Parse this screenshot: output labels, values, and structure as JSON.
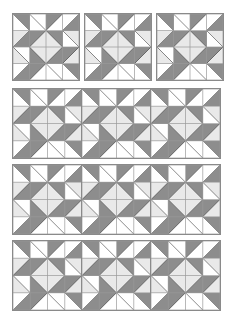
{
  "figure": {
    "background_color": "#ffffff",
    "width": 240,
    "height": 318
  },
  "palette": {
    "dark": "#8d8d8d",
    "light": "#e9e9e9",
    "white": "#ffffff",
    "stroke": "#5a5a5a",
    "grid_stroke": "#9a9a9a",
    "frame_stroke": "#8a8a8a"
  },
  "block_design": {
    "name": "pinwheel-star-block",
    "grid_rows": 4,
    "grid_cols": 4,
    "unit_type": "half-square-triangle",
    "description": "4 by 4 grid of half square triangle units arranged as a rotating pinwheel star",
    "units": [
      [
        {
          "split": "tlbr",
          "a": "dark",
          "b": "white"
        },
        {
          "split": "tlbr",
          "a": "white",
          "b": "white"
        },
        {
          "split": "trbl",
          "a": "dark",
          "b": "white"
        },
        {
          "split": "trbl",
          "a": "white",
          "b": "dark"
        }
      ],
      [
        {
          "split": "trbl",
          "a": "light",
          "b": "dark"
        },
        {
          "split": "trbl",
          "a": "dark",
          "b": "light"
        },
        {
          "split": "tlbr",
          "a": "dark",
          "b": "light"
        },
        {
          "split": "tlbr",
          "a": "light",
          "b": "white"
        }
      ],
      [
        {
          "split": "tlbr",
          "a": "white",
          "b": "light"
        },
        {
          "split": "tlbr",
          "a": "light",
          "b": "dark"
        },
        {
          "split": "trbl",
          "a": "light",
          "b": "dark"
        },
        {
          "split": "trbl",
          "a": "dark",
          "b": "light"
        }
      ],
      [
        {
          "split": "trbl",
          "a": "white",
          "b": "dark"
        },
        {
          "split": "trbl",
          "a": "dark",
          "b": "white"
        },
        {
          "split": "tlbr",
          "a": "white",
          "b": "white"
        },
        {
          "split": "tlbr",
          "a": "dark",
          "b": "white"
        }
      ]
    ]
  },
  "bands": [
    {
      "name": "band-row-1",
      "label": "Row 1 — three separated blocks",
      "x": 13,
      "y": 14,
      "block_size": 66,
      "block_count": 3,
      "gap": 6,
      "joined": false
    },
    {
      "name": "band-row-2",
      "label": "Row 2 — joined strip of three blocks",
      "x": 13,
      "y": 89,
      "block_size": 69,
      "block_count": 3,
      "gap": 0,
      "joined": true
    },
    {
      "name": "band-row-3",
      "label": "Row 3 — joined strip of three blocks",
      "x": 13,
      "y": 165,
      "block_size": 69,
      "block_count": 3,
      "gap": 0,
      "joined": true
    },
    {
      "name": "band-row-4",
      "label": "Row 4 — joined strip of three blocks",
      "x": 13,
      "y": 241,
      "block_size": 69,
      "block_count": 3,
      "gap": 0,
      "joined": true
    }
  ]
}
